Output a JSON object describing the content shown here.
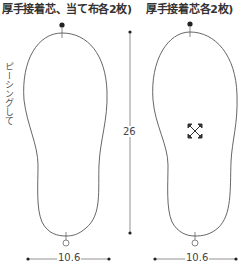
{
  "headers": {
    "left": "厚手接着芯、当て布各2枚)",
    "right": "厚手接着芯各2枚)"
  },
  "side_note": "ピーシングして",
  "dimensions": {
    "height": "26",
    "width_left": "10.6",
    "width_right": "10.6"
  },
  "icons": {
    "grain_mark": "four-way-arrow-icon"
  },
  "colors": {
    "line": "#555555",
    "text": "#333333"
  }
}
